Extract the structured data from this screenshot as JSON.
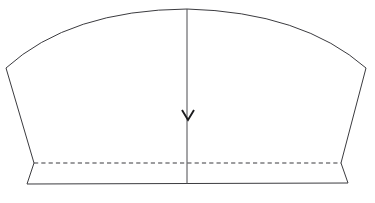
{
  "figure": {
    "type": "technical-line-drawing",
    "background_color": "#ffffff",
    "line_color": "#3b3b3f",
    "grainline_color": "#4a4a4e",
    "arrow_color": "#1c1c1e",
    "canvas": {
      "width": 375,
      "height": 203
    }
  },
  "geometry": {
    "top_curve_left": {
      "name": "top-curve-left",
      "description": "convex arc rising from left shoulder corner to center apex",
      "start": [
        6,
        68
      ],
      "control": [
        70,
        10
      ],
      "end": [
        187,
        9
      ]
    },
    "top_curve_right": {
      "name": "top-curve-right",
      "description": "convex arc falling from center apex to right shoulder corner",
      "start": [
        187,
        9
      ],
      "control": [
        302,
        12
      ],
      "end": [
        366,
        68
      ]
    },
    "left_side_edge": {
      "name": "left-side-edge",
      "description": "straight edge slanting inward from left shoulder to left hem notch",
      "start": [
        6,
        68
      ],
      "end": [
        34,
        163
      ]
    },
    "left_hem_flare": {
      "name": "left-hem-flare",
      "description": "short flare kicking outward from hem notch to bottom-left corner",
      "start": [
        34,
        163
      ],
      "end": [
        27,
        184
      ]
    },
    "bottom_edge": {
      "name": "bottom-edge",
      "description": "straight hem line across the base",
      "start": [
        27,
        184
      ],
      "end": [
        348,
        183
      ]
    },
    "right_hem_flare": {
      "name": "right-hem-flare",
      "description": "short flare kicking outward from hem notch to bottom-right corner",
      "start": [
        341,
        163
      ],
      "end": [
        348,
        183
      ]
    },
    "right_side_edge": {
      "name": "right-side-edge",
      "description": "straight edge slanting inward from right shoulder to right hem notch",
      "start": [
        366,
        68
      ],
      "end": [
        341,
        163
      ]
    },
    "dashed_fold_line": {
      "name": "dashed-fold-line",
      "description": "horizontal dashed stitching or fold guide near the hem",
      "start": [
        34,
        163
      ],
      "end": [
        341,
        163
      ],
      "dash_length": 4.2,
      "gap_length": 3.1
    },
    "grain_line": {
      "name": "grain-line",
      "description": "vertical centre grainline running from apex to hem",
      "start": [
        187,
        9
      ],
      "end": [
        187,
        184
      ]
    },
    "grain_arrow_head": {
      "name": "grain-arrow-head",
      "description": "downward chevron arrowhead on the grainline",
      "tip": [
        188,
        120
      ],
      "left_wing": [
        182,
        110
      ],
      "right_wing": [
        194,
        110
      ]
    }
  },
  "labels": {
    "none_visible": ""
  }
}
